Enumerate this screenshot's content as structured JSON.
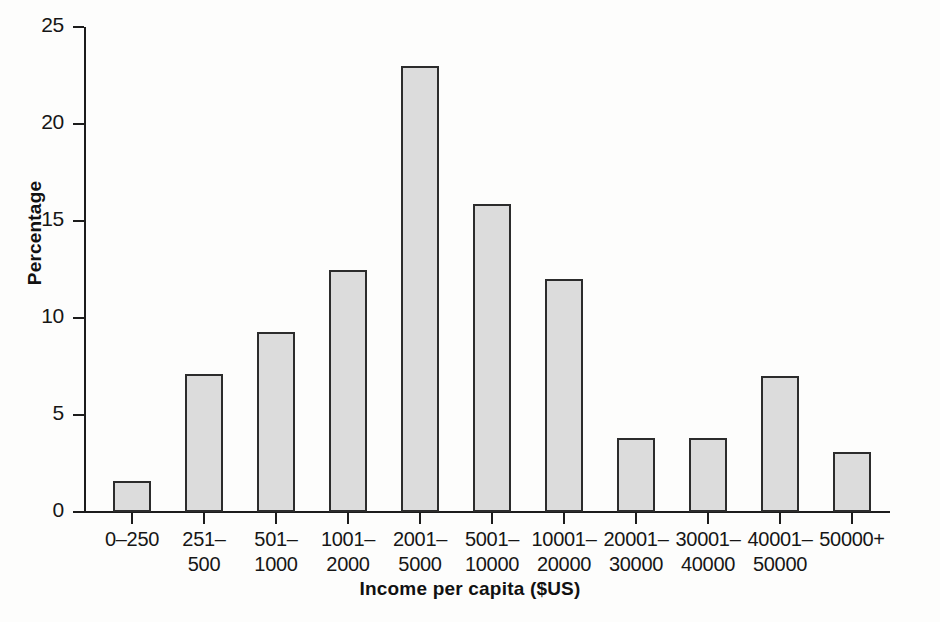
{
  "chart_data": {
    "type": "bar",
    "title": "",
    "xlabel": "Income per capita ($US)",
    "ylabel": "Percentage",
    "ylim": [
      0,
      25
    ],
    "yticks": [
      0,
      5,
      10,
      15,
      20,
      25
    ],
    "grid": false,
    "legend": null,
    "categories": [
      "0–250",
      "251–500",
      "501–1000",
      "1001–2000",
      "2001–5000",
      "5001–10000",
      "10001–20000",
      "20001–30000",
      "30001–40000",
      "40001–50000",
      "50000+"
    ],
    "category_lines": [
      {
        "l1": "0–250",
        "l2": ""
      },
      {
        "l1": "251–",
        "l2": "500"
      },
      {
        "l1": "501–",
        "l2": "1000"
      },
      {
        "l1": "1001–",
        "l2": "2000"
      },
      {
        "l1": "2001–",
        "l2": "5000"
      },
      {
        "l1": "5001–",
        "l2": "10000"
      },
      {
        "l1": "10001–",
        "l2": "20000"
      },
      {
        "l1": "20001–",
        "l2": "30000"
      },
      {
        "l1": "30001–",
        "l2": "40000"
      },
      {
        "l1": "40001–",
        "l2": "50000"
      },
      {
        "l1": "50000+",
        "l2": ""
      }
    ],
    "values": [
      1.6,
      7.1,
      9.3,
      12.5,
      23.0,
      15.9,
      12.0,
      3.8,
      3.8,
      7.0,
      3.1
    ],
    "bar_color": "#dcdcdc",
    "bar_edge_color": "#2c2c2c",
    "axis_color": "#1c1c1c",
    "background": "#fdfdfc"
  }
}
